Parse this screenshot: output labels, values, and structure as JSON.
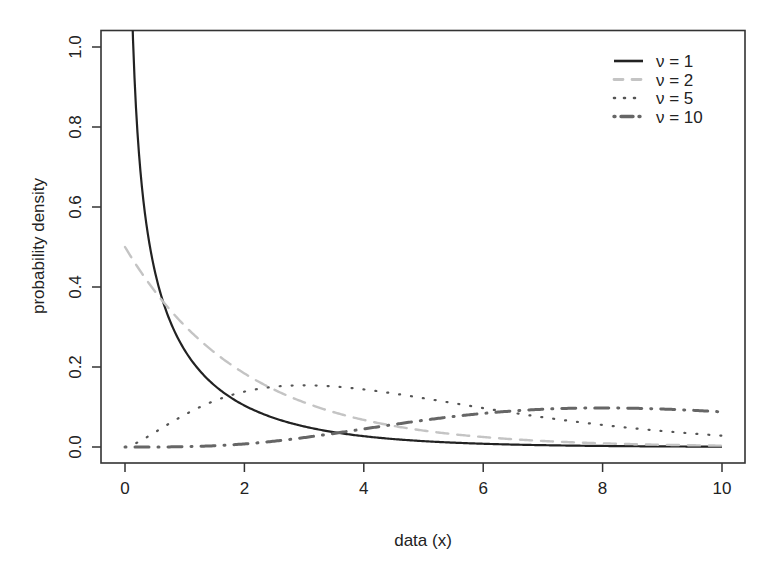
{
  "chart_data": {
    "type": "line",
    "title": "",
    "xlabel": "data (x)",
    "ylabel": "probability density",
    "xlim": [
      0,
      10
    ],
    "ylim": [
      0,
      1.0
    ],
    "x_ticks": [
      "0",
      "2",
      "4",
      "6",
      "8",
      "10"
    ],
    "y_ticks": [
      "0.0",
      "0.2",
      "0.4",
      "0.6",
      "0.8",
      "1.0"
    ],
    "grid": false,
    "legend_position": "top-right",
    "distribution": "chi-square",
    "x": [
      0,
      0.5,
      1,
      1.5,
      2,
      2.5,
      3,
      3.5,
      4,
      4.5,
      5,
      5.5,
      6,
      6.5,
      7,
      7.5,
      8,
      8.5,
      9,
      9.5,
      10
    ],
    "series": [
      {
        "name": "ν = 1",
        "df": 1,
        "style": "solid",
        "color": "#222222",
        "width": 2.2,
        "values": [
          null,
          0.4394,
          0.242,
          0.1542,
          0.1038,
          0.0719,
          0.0514,
          0.0372,
          0.027,
          0.0199,
          0.0146,
          0.0108,
          0.008,
          0.006,
          0.0045,
          0.0033,
          0.0025,
          0.0019,
          0.0014,
          0.0011,
          0.0008
        ]
      },
      {
        "name": "ν = 2",
        "df": 2,
        "style": "dashed",
        "color": "#c4c4c4",
        "width": 2.4,
        "values": [
          0.5,
          0.3894,
          0.3033,
          0.2362,
          0.1839,
          0.1433,
          0.1116,
          0.0869,
          0.0677,
          0.0527,
          0.041,
          0.032,
          0.0249,
          0.0194,
          0.0151,
          0.0118,
          0.0092,
          0.0071,
          0.0056,
          0.0043,
          0.0034
        ]
      },
      {
        "name": "ν = 5",
        "df": 5,
        "style": "dotted",
        "color": "#555555",
        "width": 2.2,
        "values": [
          0.0,
          0.0366,
          0.0807,
          0.1154,
          0.1384,
          0.1506,
          0.1542,
          0.1516,
          0.1465,
          0.1383,
          0.122,
          0.117,
          0.0975,
          0.0934,
          0.0744,
          0.0713,
          0.0551,
          0.0526,
          0.0399,
          0.0376,
          0.0283
        ]
      },
      {
        "name": "ν = 10",
        "df": 10,
        "style": "dotdash",
        "color": "#666666",
        "width": 3.0,
        "values": [
          0.0,
          0.0,
          0.0008,
          0.0039,
          0.0153,
          0.0301,
          0.0471,
          0.0643,
          0.0902,
          0.09,
          0.0668,
          0.075,
          0.1008,
          0.0957,
          0.0881,
          0.1007,
          0.0977,
          0.1001,
          0.0949,
          0.0912,
          0.0877
        ]
      }
    ]
  }
}
